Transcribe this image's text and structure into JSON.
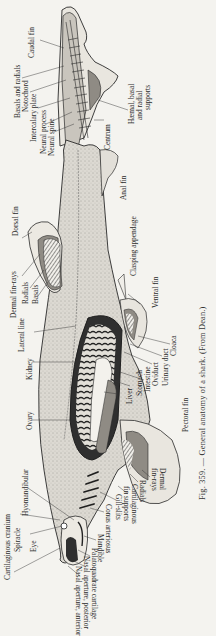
{
  "figure": {
    "caption": "Fig. 359. — General anatomy of a shark.   (From Dean.)",
    "colors": {
      "background": "#f4f3ef",
      "body_fill": "#d9d6cf",
      "line": "#2a2a2a",
      "dark_organ": "#3a3a3a",
      "mid_shade": "#9a968e",
      "light_fin": "#e8e5de"
    }
  },
  "labels": {
    "caudal_fin": "Caudal fin",
    "basals_and_radials": "Basals and radials",
    "notochord": "Notochord",
    "intercalary_plate": "Intercalary plate",
    "neural_process": "Neural process",
    "neural_spine": "Neural spine",
    "haemal_supports_1": "Hæmal, basal",
    "haemal_supports_2": "and radial",
    "haemal_supports_3": "supports",
    "centrum": "Centrum",
    "anal_fin": "Anal fin",
    "dorsal_fin": "Dorsal fin",
    "clasping_appendage": "Clasping appendage",
    "dermal_fin_rays": "Dermal fin-rays",
    "radials": "Radials",
    "basals": "Basals",
    "ventral_fin": "Ventral fin",
    "lateral_line": "Lateral line",
    "kidney": "Kidney",
    "cloaca": "Cloaca",
    "urinary_duct": "Urinary duct",
    "oviduct": "Oviduct",
    "intestine": "Intestine",
    "stomach": "Stomach",
    "liver": "Liver",
    "ovary": "Ovary",
    "pectoral_fin": "Pectoral fin",
    "dermal_fin_rays_pectoral_1": "Dermal",
    "dermal_fin_rays_pectoral_2": "fin-rays",
    "radials_pectoral": "Radials",
    "cartilaginous_fin_supports_1": "Cartilaginous",
    "cartilaginous_fin_supports_2": "fin supports",
    "gill_slits": "Gill-slits",
    "conus_arteriosus": "Conus arteriosus",
    "hyomandibular": "Hyomandibular",
    "cartilaginous_cranium": "Cartilaginous cranium",
    "spiracle": "Spiracle",
    "eye": "Eye",
    "mandible": "Mandible",
    "palatoquadrate_cartilage": "Palatoquadrate cartilage",
    "nasal_aperture_posterior": "Nasal aperture, posterior",
    "nasal_aperture_anterior": "Nasal aperture, anterior"
  }
}
